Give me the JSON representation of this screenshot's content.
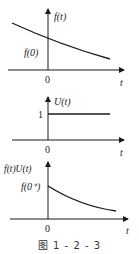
{
  "figure": {
    "caption": "图    1 - 2 - 3",
    "panels": [
      {
        "y_label": "f(t)",
        "x_label": "t",
        "origin_label": "0",
        "value_label": "f(0)",
        "curve": "decaying exponential defined for all t"
      },
      {
        "y_label": "U(t)",
        "x_label": "t",
        "origin_label": "0",
        "value_label": "1",
        "curve": "unit step"
      },
      {
        "y_label": "f(t)U(t)",
        "x_label": "t",
        "origin_label": "0",
        "value_label": "f(0⁺)",
        "curve": "decaying exponential for t ≥ 0"
      }
    ]
  },
  "colors": {
    "stroke": "#1a1a1a",
    "text": "#222222"
  }
}
